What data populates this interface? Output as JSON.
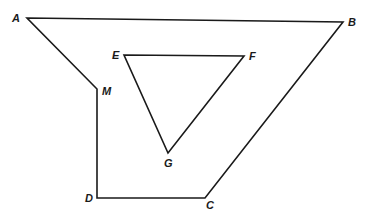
{
  "diagram": {
    "stroke_color": "#1a1a1a",
    "background": "#ffffff",
    "outer_polygon": {
      "vertices": [
        {
          "name": "A",
          "x": 27,
          "y": 18,
          "lx": 12,
          "ly": 22
        },
        {
          "name": "B",
          "x": 343,
          "y": 22,
          "lx": 348,
          "ly": 26
        },
        {
          "name": "C",
          "x": 205,
          "y": 198,
          "lx": 206,
          "ly": 209
        },
        {
          "name": "D",
          "x": 97,
          "y": 198,
          "lx": 85,
          "ly": 202
        },
        {
          "name": "M",
          "x": 97,
          "y": 89,
          "lx": 102,
          "ly": 95
        }
      ]
    },
    "inner_triangle": {
      "vertices": [
        {
          "name": "E",
          "x": 124,
          "y": 55,
          "lx": 112,
          "ly": 59
        },
        {
          "name": "F",
          "x": 244,
          "y": 56,
          "lx": 249,
          "ly": 60
        },
        {
          "name": "G",
          "x": 168,
          "y": 153,
          "lx": 164,
          "ly": 167
        }
      ]
    }
  }
}
